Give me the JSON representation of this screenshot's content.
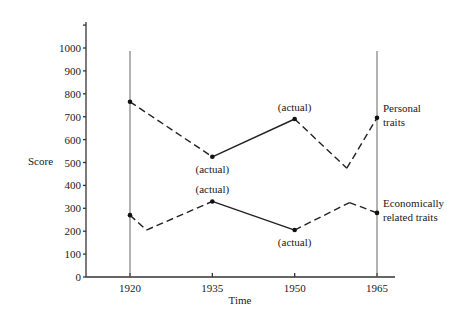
{
  "chart_data": {
    "type": "line",
    "title": "",
    "xlabel": "Time",
    "ylabel": "Score",
    "ylim": [
      0,
      1100
    ],
    "yticks": [
      0,
      100,
      200,
      300,
      400,
      500,
      600,
      700,
      800,
      900,
      1000
    ],
    "xticks": [
      1920,
      1935,
      1950,
      1965
    ],
    "xlim": [
      1908,
      1968
    ],
    "grid": false,
    "legend_position": "right (inline labels)",
    "reference_lines_x": [
      1920,
      1965
    ],
    "series": [
      {
        "name": "Personal traits",
        "label_lines": [
          "Personal",
          "traits"
        ],
        "points": [
          {
            "x": 1920,
            "y": 765,
            "marker": true
          },
          {
            "x": 1935,
            "y": 525,
            "marker": true,
            "annotation": "(actual)",
            "annotation_pos": "below"
          },
          {
            "x": 1950,
            "y": 690,
            "marker": true,
            "annotation": "(actual)",
            "annotation_pos": "above"
          },
          {
            "x": 1959.5,
            "y": 475,
            "marker": false
          },
          {
            "x": 1965,
            "y": 695,
            "marker": true
          }
        ],
        "segments": [
          {
            "from": 0,
            "to": 1,
            "style": "dashed"
          },
          {
            "from": 1,
            "to": 2,
            "style": "solid"
          },
          {
            "from": 2,
            "to": 3,
            "style": "dashed"
          },
          {
            "from": 3,
            "to": 4,
            "style": "dashed"
          }
        ]
      },
      {
        "name": "Economically related traits",
        "label_lines": [
          "Economically",
          "related traits"
        ],
        "points": [
          {
            "x": 1920,
            "y": 270,
            "marker": true
          },
          {
            "x": 1923,
            "y": 205,
            "marker": false
          },
          {
            "x": 1935,
            "y": 330,
            "marker": true,
            "annotation": "(actual)",
            "annotation_pos": "above"
          },
          {
            "x": 1950,
            "y": 205,
            "marker": true,
            "annotation": "(actual)",
            "annotation_pos": "below"
          },
          {
            "x": 1960,
            "y": 325,
            "marker": false
          },
          {
            "x": 1965,
            "y": 280,
            "marker": true
          }
        ],
        "segments": [
          {
            "from": 0,
            "to": 1,
            "style": "dashed"
          },
          {
            "from": 1,
            "to": 2,
            "style": "dashed"
          },
          {
            "from": 2,
            "to": 3,
            "style": "solid"
          },
          {
            "from": 3,
            "to": 4,
            "style": "dashed"
          },
          {
            "from": 4,
            "to": 5,
            "style": "dashed"
          }
        ]
      }
    ]
  },
  "layout": {
    "plot_left_px": 86,
    "plot_right_px": 395,
    "y0_px": 277,
    "y1000_px": 48,
    "axis_top_px": 22,
    "ref_line_top_px": 51,
    "x1920_px": 130,
    "x1965_px": 377
  }
}
